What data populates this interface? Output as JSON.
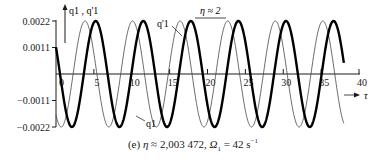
{
  "chart_data": {
    "type": "line",
    "title": "",
    "caption": "(e) η ≈ 2,003 472, Ω₁ = 42 s⁻¹",
    "caption_parts": {
      "panel": "(e)",
      "eta_symbol": "η",
      "eta_value": "≈ 2,003 472,",
      "omega_symbol": "Ω",
      "omega_sub": "1",
      "omega_value": "= 42 s",
      "omega_unit_exp": "−1"
    },
    "xlabel": "τ",
    "ylabel": "q1 , q'1",
    "xlim": [
      0,
      40
    ],
    "ylim": [
      -0.0022,
      0.0022
    ],
    "x_ticks": [
      0,
      5,
      10,
      15,
      20,
      25,
      30,
      35,
      40
    ],
    "x_tick_labels": [
      "0",
      "5",
      "10",
      "15",
      "20",
      "25",
      "30",
      "35",
      "40"
    ],
    "y_ticks": [
      0.0022,
      0.0011,
      -0.0011,
      -0.0022
    ],
    "y_tick_labels": [
      "0.0022",
      "0.0011",
      "−0.0011",
      "−0.0022"
    ],
    "grid": false,
    "annotation": "η ≈ 2",
    "series": [
      {
        "name": "q1",
        "style": "thick",
        "amplitude": 0.0022,
        "period": 6.28,
        "peak_tau": 5.24,
        "tau_range": [
          0,
          38
        ],
        "peaks_tau": [
          5.2,
          11.5,
          17.8,
          24.1,
          30.3,
          36.6
        ],
        "value_at_0": 0.0011
      },
      {
        "name": "q'1",
        "style": "thin",
        "amplitude": 0.0022,
        "period": 6.28,
        "peak_tau": 3.83,
        "tau_range": [
          0,
          38
        ],
        "peaks_tau": [
          3.8,
          10.1,
          16.4,
          22.7,
          28.9,
          35.2
        ],
        "value_at_0": -0.0017
      }
    ],
    "series_labels": [
      {
        "text": "q'1",
        "target": "q'1"
      },
      {
        "text": "q1",
        "target": "q1"
      }
    ]
  },
  "colors": {
    "ink": "#1a1a1a",
    "thin_line": "#444444",
    "background": "#ffffff"
  }
}
